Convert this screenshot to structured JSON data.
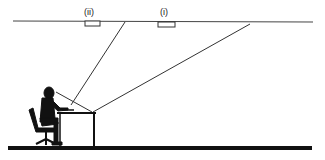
{
  "diagram": {
    "labels": {
      "light_ii": "(ii)",
      "light_i": "(i)"
    },
    "colors": {
      "line": "#333333",
      "floor": "#111111",
      "figure": "#111111",
      "background": "#ffffff"
    },
    "elements": {
      "ceiling": "ceiling line",
      "floor": "floor line",
      "light_fixtures": [
        "(ii)",
        "(i)"
      ],
      "person": "seated person at desk",
      "desk": "desk",
      "chair": "office chair",
      "sight_lines": [
        "reflection line from ceiling to keyboard",
        "reflection line from ceiling to desk edge",
        "line of sight from eye to desk"
      ]
    }
  }
}
